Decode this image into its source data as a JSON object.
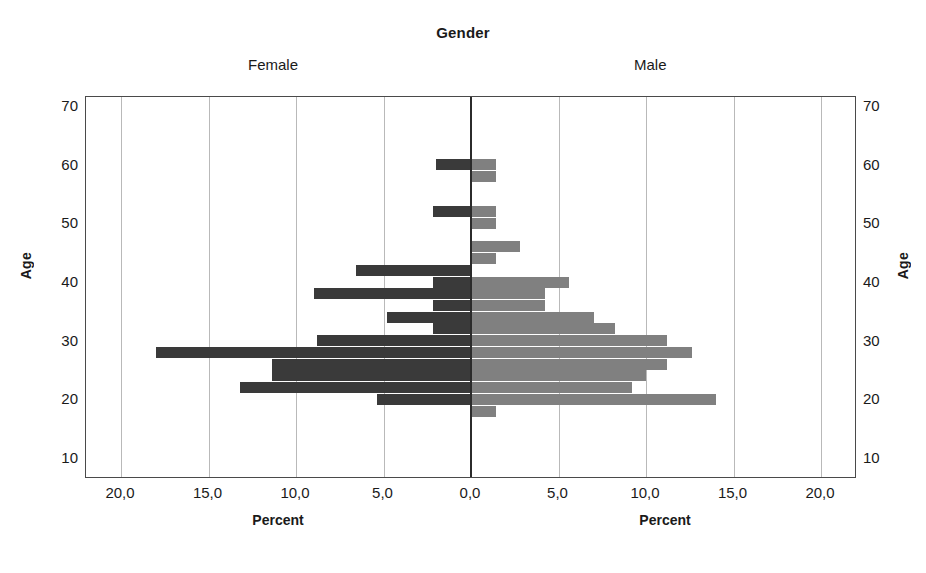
{
  "chart_data": {
    "type": "bar",
    "title": "Gender",
    "subtitle": "",
    "orientation": "horizontal-pyramid",
    "xlabel": "Percent",
    "ylabel": "Age",
    "xlim": [
      0,
      22.2
    ],
    "ylim": [
      8,
      72
    ],
    "grid": true,
    "legend_position": "top",
    "decimal_separator": ",",
    "x_tick_labels_left": [
      "20,0",
      "15,0",
      "10,0",
      "5,0",
      "0,0"
    ],
    "x_tick_labels_right": [
      "0,0",
      "5,0",
      "10,0",
      "15,0",
      "20,0"
    ],
    "x_tick_values": [
      20.0,
      15.0,
      10.0,
      5.0,
      0.0,
      5.0,
      10.0,
      15.0,
      20.0
    ],
    "y_tick_labels": [
      "70",
      "60",
      "50",
      "40",
      "30",
      "20",
      "10"
    ],
    "y_tick_values": [
      70,
      60,
      50,
      40,
      30,
      20,
      10
    ],
    "panels": [
      {
        "name": "Female",
        "side": "left",
        "color": "#3a3a3a"
      },
      {
        "name": "Male",
        "side": "right",
        "color": "#808080"
      }
    ],
    "series": [
      {
        "name": "Female",
        "side": "left",
        "color": "#3a3a3a",
        "ages": [
          60,
          52,
          42,
          40,
          38,
          36,
          34,
          32,
          30,
          28,
          26,
          24,
          22,
          20
        ],
        "values": [
          2.0,
          2.2,
          6.6,
          2.2,
          9.0,
          2.2,
          4.8,
          2.2,
          8.8,
          18.0,
          11.4,
          11.4,
          13.2,
          5.4
        ]
      },
      {
        "name": "Male",
        "side": "right",
        "color": "#808080",
        "ages": [
          60,
          58,
          52,
          50,
          46,
          44,
          40,
          38,
          36,
          34,
          32,
          30,
          28,
          26,
          24,
          22,
          20,
          18
        ],
        "values": [
          1.4,
          1.4,
          1.4,
          1.4,
          2.8,
          1.4,
          5.6,
          4.2,
          4.2,
          7.0,
          8.2,
          11.2,
          12.6,
          11.2,
          10.0,
          9.2,
          14.0,
          1.4
        ]
      }
    ],
    "bars": [
      {
        "age": 60,
        "female": 2.0,
        "male": 1.4
      },
      {
        "age": 58,
        "female": 0.0,
        "male": 1.4
      },
      {
        "age": 52,
        "female": 2.2,
        "male": 1.4
      },
      {
        "age": 50,
        "female": 0.0,
        "male": 1.4
      },
      {
        "age": 46,
        "female": 0.0,
        "male": 2.8
      },
      {
        "age": 44,
        "female": 0.0,
        "male": 1.4
      },
      {
        "age": 42,
        "female": 6.6,
        "male": 0.0
      },
      {
        "age": 40,
        "female": 2.2,
        "male": 5.6
      },
      {
        "age": 38,
        "female": 9.0,
        "male": 4.2
      },
      {
        "age": 36,
        "female": 2.2,
        "male": 4.2
      },
      {
        "age": 34,
        "female": 4.8,
        "male": 7.0
      },
      {
        "age": 32,
        "female": 2.2,
        "male": 8.2
      },
      {
        "age": 30,
        "female": 8.8,
        "male": 11.2
      },
      {
        "age": 28,
        "female": 18.0,
        "male": 12.6
      },
      {
        "age": 26,
        "female": 11.4,
        "male": 11.2
      },
      {
        "age": 24,
        "female": 11.4,
        "male": 10.0
      },
      {
        "age": 22,
        "female": 13.2,
        "male": 9.2
      },
      {
        "age": 20,
        "female": 5.4,
        "male": 14.0
      },
      {
        "age": 18,
        "female": 0.0,
        "male": 1.4
      }
    ]
  },
  "labels": {
    "title": "Gender",
    "female": "Female",
    "male": "Male",
    "age_left": "Age",
    "age_right": "Age",
    "percent_left": "Percent",
    "percent_right": "Percent"
  }
}
